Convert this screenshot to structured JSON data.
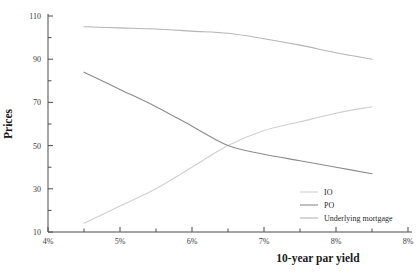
{
  "chart_data": {
    "type": "line",
    "title": "",
    "xlabel": "10-year par yield",
    "ylabel": "Prices",
    "xlim": [
      4,
      9
    ],
    "ylim": [
      10,
      110
    ],
    "grid": false,
    "legend_position": "bottom-right",
    "x_tick_labels": [
      "4%",
      "5%",
      "6%",
      "7%",
      "8%",
      "8%"
    ],
    "x_tick_values": [
      4,
      5,
      6,
      7,
      8,
      9
    ],
    "x_minor_tick_values": [
      4.5,
      5.5,
      6.5,
      7.5,
      8.5
    ],
    "y_tick_labels": [
      "10",
      "30",
      "50",
      "70",
      "90",
      "110"
    ],
    "y_tick_values": [
      10,
      30,
      50,
      70,
      90,
      110
    ],
    "y_minor_tick_values": [
      20,
      40,
      60,
      80,
      100
    ],
    "x": [
      4.5,
      5.0,
      5.5,
      6.0,
      6.5,
      7.0,
      7.5,
      8.0,
      8.5
    ],
    "series": [
      {
        "name": "IO",
        "color": "#cfcfcf",
        "values": [
          14,
          22,
          30,
          40,
          50,
          57,
          61,
          65,
          68
        ]
      },
      {
        "name": "PO",
        "color": "#8c8c8c",
        "values": [
          84,
          76,
          68,
          59,
          50,
          46,
          43,
          40,
          37
        ]
      },
      {
        "name": "Underlying mortgage",
        "color": "#b5b5b5",
        "values": [
          105,
          104.5,
          104,
          103,
          102,
          99.5,
          96.5,
          93,
          90
        ]
      }
    ],
    "annotations": []
  },
  "legend": {
    "entries": [
      {
        "label": "IO"
      },
      {
        "label": "PO"
      },
      {
        "label": "Underlying mortgage"
      }
    ]
  }
}
